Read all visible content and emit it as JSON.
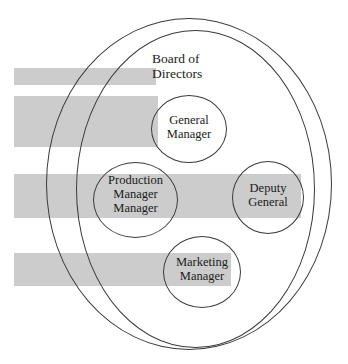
{
  "diagram": {
    "type": "nested-ellipse-venn",
    "background_color": "#ffffff",
    "outline_color": "#3a3a3a",
    "artifact_bar_color": "#cccccc",
    "outer_group": {
      "label_line1": "Board of",
      "label_line2": "Directors"
    },
    "nodes": [
      {
        "name": "general-manager",
        "line1": "General",
        "line2": "Manager",
        "line3": ""
      },
      {
        "name": "production-manager",
        "line1": "Production",
        "line2": "Manager",
        "line3": "Manager"
      },
      {
        "name": "deputy-general",
        "line1": "Deputy",
        "line2": "General",
        "line3": ""
      },
      {
        "name": "marketing-manager",
        "line1": "Marketing",
        "line2": "Manager",
        "line3": ""
      }
    ]
  }
}
